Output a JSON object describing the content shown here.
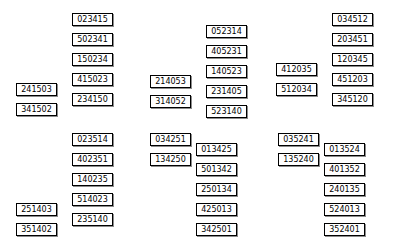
{
  "figure": {
    "background_color": "#ffffff",
    "node_border_color": "#000000",
    "node_fill_color": "#ffffff",
    "edge_color": "#000000",
    "node_width": 41,
    "node_height": 13
  },
  "groups": [
    {
      "id": "group-top-left",
      "x": 16,
      "y": 8,
      "chain": [
        {
          "label": "023415",
          "x": 56,
          "y": 5
        },
        {
          "label": "502341",
          "x": 56,
          "y": 25
        },
        {
          "label": "150234",
          "x": 56,
          "y": 45
        },
        {
          "label": "415023",
          "x": 56,
          "y": 65
        },
        {
          "label": "234150",
          "x": 56,
          "y": 85
        }
      ],
      "side": [
        {
          "label": "241503",
          "x": 0,
          "y": 75
        },
        {
          "label": "341502",
          "x": 0,
          "y": 95
        }
      ],
      "attach_index": 4,
      "loop": {
        "from": 0,
        "to": 4,
        "bulge": 26
      }
    },
    {
      "id": "group-top-middle",
      "x": 150,
      "y": 20,
      "chain": [
        {
          "label": "052314",
          "x": 56,
          "y": 5
        },
        {
          "label": "405231",
          "x": 56,
          "y": 25
        },
        {
          "label": "140523",
          "x": 56,
          "y": 45
        },
        {
          "label": "231405",
          "x": 56,
          "y": 65
        },
        {
          "label": "523140",
          "x": 56,
          "y": 85
        }
      ],
      "side": [
        {
          "label": "214053",
          "x": 0,
          "y": 55
        },
        {
          "label": "314052",
          "x": 0,
          "y": 75
        }
      ],
      "attach_index": 3,
      "loop": {
        "from": 0,
        "to": 4,
        "bulge": 26
      }
    },
    {
      "id": "group-top-right",
      "x": 276,
      "y": 8,
      "chain": [
        {
          "label": "034512",
          "x": 56,
          "y": 5
        },
        {
          "label": "203451",
          "x": 56,
          "y": 25
        },
        {
          "label": "120345",
          "x": 56,
          "y": 45
        },
        {
          "label": "451203",
          "x": 56,
          "y": 65
        },
        {
          "label": "345120",
          "x": 56,
          "y": 85
        }
      ],
      "side": [
        {
          "label": "412035",
          "x": 0,
          "y": 55
        },
        {
          "label": "512034",
          "x": 0,
          "y": 75
        }
      ],
      "attach_index": 3,
      "loop": {
        "from": 0,
        "to": 4,
        "bulge": 26
      }
    },
    {
      "id": "group-bottom-left",
      "x": 16,
      "y": 128,
      "chain": [
        {
          "label": "023514",
          "x": 56,
          "y": 5
        },
        {
          "label": "402351",
          "x": 56,
          "y": 25
        },
        {
          "label": "140235",
          "x": 56,
          "y": 45
        },
        {
          "label": "514023",
          "x": 56,
          "y": 65
        },
        {
          "label": "235140",
          "x": 56,
          "y": 85
        }
      ],
      "side": [
        {
          "label": "251403",
          "x": 0,
          "y": 75
        },
        {
          "label": "351402",
          "x": 0,
          "y": 95
        }
      ],
      "attach_index": 4,
      "loop": {
        "from": 0,
        "to": 4,
        "bulge": 26
      }
    },
    {
      "id": "group-bottom-middle",
      "x": 150,
      "y": 128,
      "chain": [
        {
          "label": "013425",
          "x": 46,
          "y": 15
        },
        {
          "label": "501342",
          "x": 46,
          "y": 35
        },
        {
          "label": "250134",
          "x": 46,
          "y": 55
        },
        {
          "label": "425013",
          "x": 46,
          "y": 75
        },
        {
          "label": "342501",
          "x": 46,
          "y": 95
        }
      ],
      "side": [
        {
          "label": "034251",
          "x": 0,
          "y": 5
        },
        {
          "label": "134250",
          "x": 0,
          "y": 25
        }
      ],
      "attach_index": 0,
      "loop": {
        "from": 0,
        "to": 4,
        "bulge": 26
      }
    },
    {
      "id": "group-bottom-right",
      "x": 278,
      "y": 128,
      "chain": [
        {
          "label": "013524",
          "x": 46,
          "y": 15
        },
        {
          "label": "401352",
          "x": 46,
          "y": 35
        },
        {
          "label": "240135",
          "x": 46,
          "y": 55
        },
        {
          "label": "524013",
          "x": 46,
          "y": 75
        },
        {
          "label": "352401",
          "x": 46,
          "y": 95
        }
      ],
      "side": [
        {
          "label": "035241",
          "x": 0,
          "y": 5
        },
        {
          "label": "135240",
          "x": 0,
          "y": 25
        }
      ],
      "attach_index": 0,
      "loop": {
        "from": 0,
        "to": 4,
        "bulge": 26
      }
    }
  ]
}
